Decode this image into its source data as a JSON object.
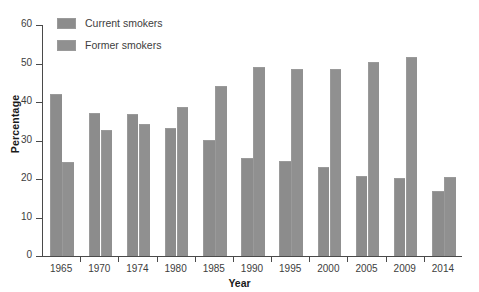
{
  "chart_data": {
    "type": "bar",
    "title": "",
    "subtitle": "",
    "xlabel": "Year",
    "ylabel": "Percentage",
    "categories": [
      "1965",
      "1970",
      "1974",
      "1980",
      "1985",
      "1990",
      "1995",
      "2000",
      "2005",
      "2009",
      "2014"
    ],
    "series": [
      {
        "name": "Current smokers",
        "color": "#8c8c8c",
        "values": [
          42.1,
          37.2,
          36.9,
          33.2,
          30.1,
          25.5,
          24.7,
          23.2,
          20.9,
          20.3,
          16.8
        ]
      },
      {
        "name": "Former smokers",
        "color": "#909090",
        "values": [
          24.3,
          32.8,
          34.4,
          38.7,
          44.2,
          49.1,
          48.7,
          48.5,
          50.5,
          51.6,
          20.6
        ]
      }
    ],
    "ylim": [
      0,
      60
    ],
    "yticks": [
      0,
      10,
      20,
      30,
      40,
      50,
      60
    ],
    "ytick_labels": [
      "0",
      "10",
      "20",
      "30",
      "40",
      "50",
      "60"
    ],
    "grid": false,
    "legend_position": "top-left",
    "annotations": []
  },
  "legend": {
    "items": [
      {
        "label": "Current smokers"
      },
      {
        "label": "Former smokers"
      }
    ]
  },
  "axes": {
    "x_title": "Year",
    "y_title": "Percentage"
  }
}
